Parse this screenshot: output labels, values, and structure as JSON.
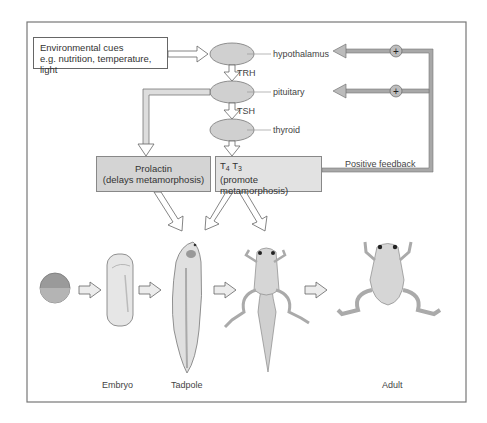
{
  "figure": {
    "environment_box": {
      "line1": "Environmental cues",
      "line2": "e.g. nutrition, temperature, light"
    },
    "glands": [
      {
        "label": "hypothalamus"
      },
      {
        "label": "pituitary"
      },
      {
        "label": "thyroid"
      }
    ],
    "hormones": {
      "trh": "TRH",
      "tsh": "TSH"
    },
    "prolactin_box": {
      "line1": "Prolactin",
      "line2": "(delays metamorphosis)"
    },
    "thyroid_box": {
      "t4": "T",
      "t4_sub": "4",
      "t3": "T",
      "t3_sub": "3",
      "line2": "(promote metamorphosis)"
    },
    "feedback": {
      "label": "Positive feedback",
      "symbol": "+"
    },
    "stages": [
      {
        "name": "egg",
        "label": ""
      },
      {
        "name": "embryo",
        "label": "Embryo"
      },
      {
        "name": "tadpole",
        "label": "Tadpole"
      },
      {
        "name": "metamorphosing-froglet",
        "label": ""
      },
      {
        "name": "adult-frog",
        "label": "Adult"
      }
    ],
    "colors": {
      "frame": "#777777",
      "ellipse_fill": "#d0d0d0",
      "arrow_fill": "#ffffff",
      "feedback_line": "#8a8a8a",
      "animal_fill": "#d8d8d8",
      "prolactin_box": "#d4d4d4",
      "thyroid_box": "#e2e2e2"
    }
  }
}
